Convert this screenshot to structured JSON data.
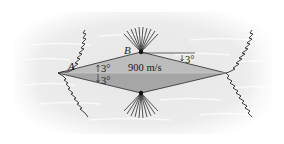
{
  "diagram": {
    "labels": {
      "leading_edge": "A",
      "top_vertex": "B",
      "speed": "900 m/s",
      "half_angle_upper": "3°",
      "half_angle_lower": "3°",
      "rear_angle": "3°"
    },
    "colors": {
      "airfoil_upper": "#b9b9b9",
      "airfoil_lower": "#a8a8a8",
      "outline": "#3a3a3a",
      "background_flow": "#e9e9e9",
      "shock": "#2b2b2b"
    }
  }
}
